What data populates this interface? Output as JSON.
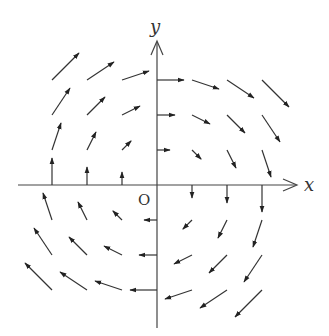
{
  "diagram": {
    "type": "vector-field",
    "field": {
      "fx": "y",
      "fy": "-x"
    },
    "axes": {
      "x_label": "x",
      "y_label": "y",
      "origin_label": "O"
    },
    "grid": {
      "x_values": [
        -3,
        -2,
        -1,
        0,
        1,
        2,
        3
      ],
      "y_values": [
        -3,
        -2,
        -1,
        0,
        1,
        2,
        3
      ],
      "exclude_origin": true
    },
    "colors": {
      "axis": "#444444",
      "arrow": "#333333",
      "background": "#ffffff"
    }
  }
}
